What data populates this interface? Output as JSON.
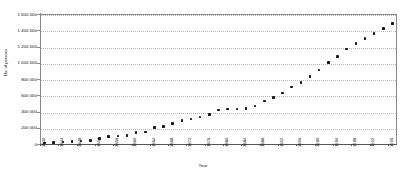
{
  "chart_data": {
    "type": "scatter",
    "title": "",
    "xlabel": "Year",
    "ylabel": "No. of persons",
    "ylim": [
      0,
      1600000
    ],
    "xlim": [
      1840,
      1918
    ],
    "grid": true,
    "legend": false,
    "marker": "filled-square",
    "marker_color": "#1a1a1a",
    "y_ticks": [
      0,
      200000,
      400000,
      600000,
      800000,
      1000000,
      1200000,
      1400000,
      1600000
    ],
    "y_tick_labels": [
      "0",
      "200 000",
      "400 000",
      "600 000",
      "800 000",
      "1 000 000",
      "1 200 000",
      "1 400 000",
      "1 600 000"
    ],
    "x_tick_labels": [
      "1840",
      "1844",
      "1848",
      "1852",
      "1856",
      "1860",
      "1864",
      "1868",
      "1872",
      "1876",
      "1880",
      "1884",
      "1888",
      "1892",
      "1896",
      "1900",
      "1904",
      "1908",
      "1912",
      "1916"
    ],
    "x": [
      1841,
      1843,
      1845,
      1847,
      1849,
      1851,
      1853,
      1855,
      1857,
      1859,
      1861,
      1863,
      1865,
      1867,
      1869,
      1871,
      1873,
      1875,
      1877,
      1879,
      1881,
      1883,
      1885,
      1887,
      1889,
      1891,
      1893,
      1895,
      1897,
      1899,
      1901,
      1903,
      1905,
      1907,
      1909,
      1911,
      1913,
      1915,
      1917
    ],
    "values": [
      12000,
      18000,
      24000,
      30000,
      38000,
      46000,
      70000,
      90000,
      100000,
      105000,
      140000,
      150000,
      200000,
      215000,
      250000,
      290000,
      310000,
      330000,
      360000,
      420000,
      430000,
      430000,
      440000,
      470000,
      530000,
      570000,
      630000,
      700000,
      760000,
      830000,
      910000,
      1000000,
      1080000,
      1170000,
      1240000,
      1300000,
      1360000,
      1420000,
      1480000
    ]
  },
  "axes": {
    "y_title": "No. of persons",
    "x_title": "Year"
  }
}
